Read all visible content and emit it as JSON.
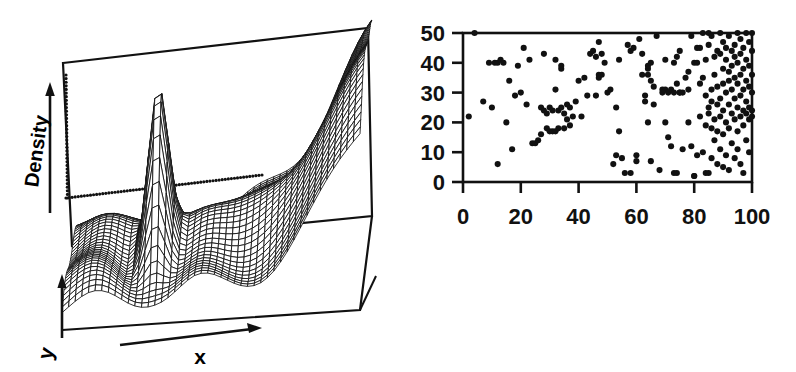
{
  "figure": {
    "title": "",
    "background_color": "#ffffff",
    "ink_color": "#111111",
    "panels": [
      "surface-density-plot",
      "scatter-plot"
    ]
  },
  "surface_panel": {
    "axis_labels": {
      "vertical": "Density",
      "depth": "y",
      "horizontal": "x"
    },
    "icons": {
      "density_arrow": "up-arrow-icon",
      "y_arrow": "up-arrow-icon",
      "x_arrow": "right-arrow-icon"
    },
    "reference_line_style": "dotted"
  },
  "scatter_panel": {
    "x_ticks": [
      "0",
      "20",
      "40",
      "60",
      "80",
      "100"
    ],
    "y_ticks": [
      "0",
      "10",
      "20",
      "30",
      "40",
      "50"
    ],
    "xlabel": "",
    "ylabel": ""
  },
  "chart_data": [
    {
      "type": "surface",
      "name": "density-surface",
      "title": "",
      "xlabel": "x",
      "ylabel": "y",
      "zlabel": "Density",
      "grid": true,
      "mesh": "wireframe",
      "description": "3D kernel density surface: one tall narrow central peak, several smaller bumps, and a broad rising ridge toward the far right edge",
      "peaks": [
        {
          "x": 0.3,
          "y": 0.45,
          "height": 1.0,
          "width": 0.035,
          "label": "tall narrow central spike"
        },
        {
          "x": 0.12,
          "y": 0.55,
          "height": 0.26,
          "width": 0.09,
          "label": "small left bump"
        },
        {
          "x": 0.47,
          "y": 0.5,
          "height": 0.22,
          "width": 0.09,
          "label": "small mid bump"
        },
        {
          "x": 0.62,
          "y": 0.58,
          "height": 0.2,
          "width": 0.1,
          "label": "small right-mid bump"
        },
        {
          "x": 0.97,
          "y": 0.5,
          "height": 0.78,
          "width": 0.16,
          "label": "broad right ridge"
        }
      ],
      "baseline": 0.06,
      "reference_lines": [
        {
          "style": "dotted",
          "orientation": "horizontal",
          "level": 0.55
        }
      ],
      "axis_ranges": {
        "x": [
          0,
          1
        ],
        "y": [
          0,
          1
        ],
        "z": [
          0,
          1
        ]
      }
    },
    {
      "type": "scatter",
      "name": "sample-scatter",
      "title": "",
      "xlabel": "",
      "ylabel": "",
      "xlim": [
        0,
        100
      ],
      "ylim": [
        0,
        50
      ],
      "xticks": [
        0,
        20,
        40,
        60,
        80,
        100
      ],
      "yticks": [
        0,
        10,
        20,
        30,
        40,
        50
      ],
      "grid": false,
      "legend": null,
      "marker": "filled-circle",
      "marker_color": "#111111",
      "n_points": 218,
      "points": [
        [
          2,
          22
        ],
        [
          4,
          50
        ],
        [
          7,
          27
        ],
        [
          9,
          40
        ],
        [
          10,
          25
        ],
        [
          11,
          40
        ],
        [
          12,
          40
        ],
        [
          12,
          6
        ],
        [
          13,
          41
        ],
        [
          14,
          40
        ],
        [
          15,
          20
        ],
        [
          16,
          34
        ],
        [
          17,
          11
        ],
        [
          18,
          29
        ],
        [
          19,
          39
        ],
        [
          20,
          30
        ],
        [
          21,
          45
        ],
        [
          22,
          26
        ],
        [
          23,
          41
        ],
        [
          24,
          13
        ],
        [
          25,
          13
        ],
        [
          26,
          14
        ],
        [
          27,
          16
        ],
        [
          27,
          25
        ],
        [
          28,
          43
        ],
        [
          28,
          24
        ],
        [
          29,
          18
        ],
        [
          29,
          23
        ],
        [
          30,
          17
        ],
        [
          30,
          25
        ],
        [
          31,
          17
        ],
        [
          31,
          24
        ],
        [
          32,
          31
        ],
        [
          32,
          41
        ],
        [
          32,
          17
        ],
        [
          33,
          24
        ],
        [
          33,
          18
        ],
        [
          34,
          38
        ],
        [
          34,
          39
        ],
        [
          34,
          25
        ],
        [
          35,
          23
        ],
        [
          35,
          18
        ],
        [
          36,
          26
        ],
        [
          36,
          21
        ],
        [
          37,
          25
        ],
        [
          37,
          19
        ],
        [
          38,
          22
        ],
        [
          39,
          27
        ],
        [
          40,
          34
        ],
        [
          41,
          22
        ],
        [
          42,
          35
        ],
        [
          43,
          29
        ],
        [
          44,
          43
        ],
        [
          45,
          44
        ],
        [
          46,
          42
        ],
        [
          46,
          29
        ],
        [
          47,
          47
        ],
        [
          47,
          36
        ],
        [
          47,
          35
        ],
        [
          48,
          43
        ],
        [
          48,
          36
        ],
        [
          49,
          40
        ],
        [
          50,
          30
        ],
        [
          51,
          31
        ],
        [
          52,
          6
        ],
        [
          53,
          9
        ],
        [
          54,
          17
        ],
        [
          54,
          41
        ],
        [
          55,
          8
        ],
        [
          56,
          3
        ],
        [
          57,
          46
        ],
        [
          58,
          3
        ],
        [
          59,
          45
        ],
        [
          60,
          7
        ],
        [
          60,
          9
        ],
        [
          61,
          48
        ],
        [
          62,
          43
        ],
        [
          63,
          29
        ],
        [
          63,
          27
        ],
        [
          64,
          38
        ],
        [
          64,
          36
        ],
        [
          64,
          39
        ],
        [
          64,
          20
        ],
        [
          65,
          40
        ],
        [
          65,
          34
        ],
        [
          65,
          7
        ],
        [
          66,
          26
        ],
        [
          66,
          32
        ],
        [
          67,
          49
        ],
        [
          68,
          4
        ],
        [
          69,
          31
        ],
        [
          70,
          31
        ],
        [
          70,
          41
        ],
        [
          70,
          20
        ],
        [
          71,
          30
        ],
        [
          71,
          15
        ],
        [
          72,
          31
        ],
        [
          72,
          12
        ],
        [
          73,
          40
        ],
        [
          73,
          30
        ],
        [
          73,
          3
        ],
        [
          74,
          42
        ],
        [
          74,
          33
        ],
        [
          74,
          3
        ],
        [
          75,
          44
        ],
        [
          75,
          30
        ],
        [
          76,
          11
        ],
        [
          77,
          35
        ],
        [
          78,
          37
        ],
        [
          78,
          20
        ],
        [
          79,
          49
        ],
        [
          79,
          12
        ],
        [
          80,
          40
        ],
        [
          80,
          2
        ],
        [
          80,
          2
        ],
        [
          81,
          45
        ],
        [
          81,
          40
        ],
        [
          81,
          9
        ],
        [
          82,
          33
        ],
        [
          82,
          22
        ],
        [
          83,
          50
        ],
        [
          83,
          35
        ],
        [
          83,
          10
        ],
        [
          84,
          41
        ],
        [
          84,
          29
        ],
        [
          84,
          19
        ],
        [
          84,
          3
        ],
        [
          85,
          50
        ],
        [
          85,
          46
        ],
        [
          85,
          25
        ],
        [
          85,
          23
        ],
        [
          85,
          3
        ],
        [
          86,
          49
        ],
        [
          86,
          31
        ],
        [
          86,
          27
        ],
        [
          86,
          18
        ],
        [
          86,
          8
        ],
        [
          87,
          42
        ],
        [
          87,
          36
        ],
        [
          87,
          21
        ],
        [
          87,
          14
        ],
        [
          88,
          44
        ],
        [
          88,
          32
        ],
        [
          88,
          26
        ],
        [
          88,
          17
        ],
        [
          88,
          6
        ],
        [
          89,
          50
        ],
        [
          89,
          43
        ],
        [
          89,
          28
        ],
        [
          89,
          22
        ],
        [
          89,
          11
        ],
        [
          90,
          47
        ],
        [
          90,
          38
        ],
        [
          90,
          33
        ],
        [
          90,
          24
        ],
        [
          90,
          16
        ],
        [
          90,
          5
        ],
        [
          91,
          45
        ],
        [
          91,
          41
        ],
        [
          91,
          30
        ],
        [
          91,
          20
        ],
        [
          91,
          9
        ],
        [
          92,
          49
        ],
        [
          92,
          37
        ],
        [
          92,
          34
        ],
        [
          92,
          26
        ],
        [
          92,
          18
        ],
        [
          92,
          4
        ],
        [
          93,
          44
        ],
        [
          93,
          39
        ],
        [
          93,
          31
        ],
        [
          93,
          23
        ],
        [
          93,
          13
        ],
        [
          94,
          46
        ],
        [
          94,
          42
        ],
        [
          94,
          35
        ],
        [
          94,
          28
        ],
        [
          94,
          21
        ],
        [
          94,
          8
        ],
        [
          95,
          50
        ],
        [
          95,
          40
        ],
        [
          95,
          33
        ],
        [
          95,
          25
        ],
        [
          95,
          17
        ],
        [
          95,
          11
        ],
        [
          96,
          48
        ],
        [
          96,
          43
        ],
        [
          96,
          36
        ],
        [
          96,
          29
        ],
        [
          96,
          22
        ],
        [
          96,
          6
        ],
        [
          97,
          45
        ],
        [
          97,
          38
        ],
        [
          97,
          31
        ],
        [
          97,
          24
        ],
        [
          97,
          19
        ],
        [
          97,
          3
        ],
        [
          98,
          50
        ],
        [
          98,
          41
        ],
        [
          98,
          34
        ],
        [
          98,
          27
        ],
        [
          98,
          23
        ],
        [
          98,
          14
        ],
        [
          99,
          47
        ],
        [
          99,
          39
        ],
        [
          99,
          32
        ],
        [
          99,
          25
        ],
        [
          99,
          21
        ],
        [
          99,
          10
        ],
        [
          100,
          44
        ],
        [
          100,
          36
        ],
        [
          100,
          30
        ],
        [
          100,
          24
        ],
        [
          100,
          22
        ],
        [
          100,
          50
        ],
        [
          82,
          45
        ],
        [
          78,
          31
        ],
        [
          76,
          30
        ],
        [
          75,
          30
        ],
        [
          69,
          30
        ],
        [
          62,
          36
        ],
        [
          58,
          44
        ],
        [
          53,
          25
        ]
      ]
    }
  ]
}
